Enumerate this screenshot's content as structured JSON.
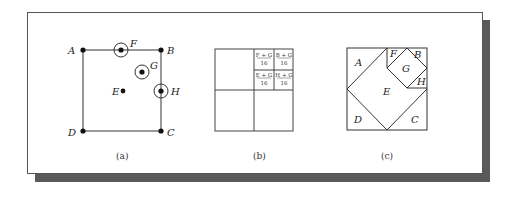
{
  "figure": {
    "panels": [
      {
        "id": "a",
        "caption": "(a)",
        "points": [
          {
            "label": "A",
            "x": 83,
            "y": 50,
            "circled": false
          },
          {
            "label": "B",
            "x": 161,
            "y": 50,
            "circled": false
          },
          {
            "label": "C",
            "x": 161,
            "y": 131,
            "circled": false
          },
          {
            "label": "D",
            "x": 83,
            "y": 131,
            "circled": false
          },
          {
            "label": "E",
            "x": 123,
            "y": 91,
            "circled": false
          },
          {
            "label": "F",
            "x": 121,
            "y": 50,
            "circled": true
          },
          {
            "label": "G",
            "x": 142,
            "y": 72,
            "circled": true
          },
          {
            "label": "H",
            "x": 161,
            "y": 91,
            "circled": true
          }
        ]
      },
      {
        "id": "b",
        "caption": "(b)",
        "cells": [
          {
            "numerator": "F + G",
            "denominator": "16"
          },
          {
            "numerator": "B + G",
            "denominator": "16"
          },
          {
            "numerator": "E + G",
            "denominator": "16"
          },
          {
            "numerator": "H + G",
            "denominator": "16"
          }
        ]
      },
      {
        "id": "c",
        "caption": "(c)",
        "regions": [
          "A",
          "B",
          "C",
          "D",
          "E",
          "F",
          "G",
          "H"
        ]
      }
    ],
    "colors": {
      "line": "#333333",
      "shadow": "#5a5a5a",
      "background": "#ffffff"
    }
  }
}
